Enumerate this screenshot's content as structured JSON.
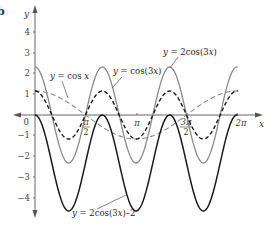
{
  "panel_letter": "b",
  "chart_data": {
    "type": "line",
    "title": "",
    "xlabel": "x",
    "ylabel": "y",
    "xlim": [
      0,
      6.2832
    ],
    "ylim": [
      -4.5,
      4.5
    ],
    "grid": false,
    "legend_position": "inline annotations",
    "x_ticks": [
      {
        "value": 1.5708,
        "label_num": "π",
        "label_den": "2"
      },
      {
        "value": 3.1416,
        "label": "π"
      },
      {
        "value": 4.7124,
        "label_num": "3π",
        "label_den": "2"
      },
      {
        "value": 6.2832,
        "label": "2π"
      }
    ],
    "y_ticks": [
      {
        "value": 4,
        "label": "4"
      },
      {
        "value": 3,
        "label": "3"
      },
      {
        "value": 2,
        "label": "2"
      },
      {
        "value": 1,
        "label": "1"
      },
      {
        "value": 0,
        "label": "0"
      },
      {
        "value": -1,
        "label": "−1"
      },
      {
        "value": -2,
        "label": "−2"
      },
      {
        "value": -3,
        "label": "−3"
      },
      {
        "value": -4,
        "label": "−4"
      }
    ],
    "series": [
      {
        "name": "y = cos x",
        "expr": "cos(x)",
        "style": "dashed",
        "color": "#8a8a8a",
        "x": [
          0,
          1.5708,
          3.1416,
          4.7124,
          6.2832
        ],
        "values": [
          1,
          0,
          -1,
          0,
          1
        ]
      },
      {
        "name": "y = cos(3x)",
        "expr": "cos(3x)",
        "style": "dashed",
        "color": "#1a1a1a",
        "x": [
          0,
          0.5236,
          1.0472,
          1.5708,
          2.0944,
          2.618,
          3.1416,
          3.6652,
          4.1888,
          4.7124,
          5.236,
          5.7596,
          6.2832
        ],
        "values": [
          1,
          0,
          -1,
          0,
          1,
          0,
          -1,
          0,
          1,
          0,
          -1,
          0,
          1
        ]
      },
      {
        "name": "y = 2cos(3x)",
        "expr": "2cos(3x)",
        "style": "solid",
        "color": "#8a8a8a",
        "x": [
          0,
          0.5236,
          1.0472,
          1.5708,
          2.0944,
          2.618,
          3.1416,
          3.6652,
          4.1888,
          4.7124,
          5.236,
          5.7596,
          6.2832
        ],
        "values": [
          2,
          0,
          -2,
          0,
          2,
          0,
          -2,
          0,
          2,
          0,
          -2,
          0,
          2
        ]
      },
      {
        "name": "y = 2cos(3x)–2",
        "expr": "2cos(3x)-2",
        "style": "solid",
        "color": "#1a1a1a",
        "x": [
          0,
          0.5236,
          1.0472,
          1.5708,
          2.0944,
          2.618,
          3.1416,
          3.6652,
          4.1888,
          4.7124,
          5.236,
          5.7596,
          6.2832
        ],
        "values": [
          0,
          -2,
          -4,
          -2,
          0,
          -2,
          -4,
          -2,
          0,
          -2,
          -4,
          -2,
          0
        ]
      }
    ],
    "annotations": [
      {
        "text": "y = cos x",
        "target": "cos(x)"
      },
      {
        "text": "y = cos(3x)",
        "target": "cos(3x)"
      },
      {
        "text": "y = 2cos(3x)",
        "target": "2cos(3x)"
      },
      {
        "text": "y = 2cos(3x)–2",
        "target": "2cos(3x)-2"
      }
    ]
  },
  "labels": {
    "cosx": {
      "y": "y",
      "eq": " = cos ",
      "x": "x"
    },
    "cos3x": {
      "y": "y",
      "eq": " = cos(3",
      "x": "x",
      "tail": ")"
    },
    "twocos3x": {
      "y": "y",
      "eq": " = 2cos(3",
      "x": "x",
      "tail": ")"
    },
    "twocos3xm2": {
      "y": "y",
      "eq": " = 2cos(3",
      "x": "x",
      "tail": ")–2"
    }
  },
  "ticks": {
    "y": [
      "4",
      "3",
      "2",
      "1",
      "0",
      "−1",
      "−2",
      "−3",
      "−4"
    ],
    "x_pi_half_num": "π",
    "x_pi_half_den": "2",
    "x_pi": "π",
    "x_3pi_half_num": "3π",
    "x_3pi_half_den": "2",
    "x_2pi": "2π"
  },
  "axis_labels": {
    "x": "x",
    "y": "y"
  }
}
